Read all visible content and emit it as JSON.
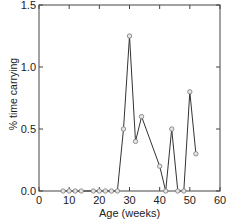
{
  "chart_data": {
    "type": "line",
    "title": "",
    "xlabel": "Age (weeks)",
    "ylabel": "% time carrying",
    "xlim": [
      0,
      60
    ],
    "ylim": [
      0,
      1.5
    ],
    "xticks": [
      0,
      10,
      20,
      30,
      40,
      50,
      60
    ],
    "yticks": [
      0.0,
      0.5,
      1.0,
      1.5
    ],
    "xtick_labels": [
      "0",
      "10",
      "20",
      "30",
      "40",
      "50",
      "60"
    ],
    "ytick_labels": [
      "0.0",
      "0.5",
      "1.0",
      "1.5"
    ],
    "grid": false,
    "legend": null,
    "series": [
      {
        "name": "% time carrying",
        "marker": "open-circle",
        "x": [
          8,
          10,
          12,
          14,
          18,
          20,
          22,
          24,
          26,
          28,
          30,
          32,
          34,
          40,
          42,
          44,
          46,
          48,
          50,
          52
        ],
        "y": [
          0,
          0,
          0,
          0,
          0,
          0,
          0,
          0,
          0,
          0.5,
          1.25,
          0.4,
          0.6,
          0.2,
          0,
          0.5,
          0,
          0,
          0.8,
          0.3
        ]
      }
    ]
  },
  "colors": {
    "line": "#333333",
    "marker_fill": "#e6e6e6",
    "marker_stroke": "#777777",
    "axis": "#444444"
  }
}
